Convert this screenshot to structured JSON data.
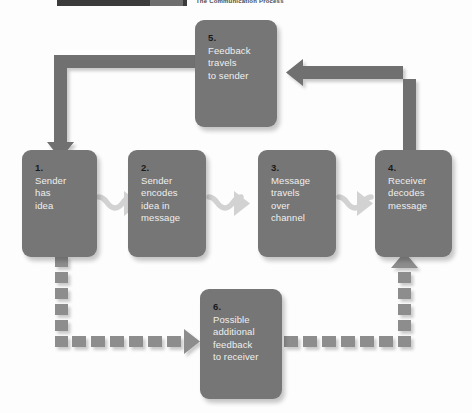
{
  "header": {
    "caption": "The Communication Process",
    "tab_label": "",
    "number_label": ""
  },
  "diagram": {
    "title": "The Communication Process",
    "type": "process-flow-cycle",
    "nodes": [
      {
        "id": "node1",
        "number": "1.",
        "lines": [
          "Sender",
          "has",
          "idea"
        ],
        "text": "Sender has idea"
      },
      {
        "id": "node2",
        "number": "2.",
        "lines": [
          "Sender",
          "encodes",
          "idea in",
          "message"
        ],
        "text": "Sender encodes idea in message"
      },
      {
        "id": "node3",
        "number": "3.",
        "lines": [
          "Message",
          "travels",
          "over",
          "channel"
        ],
        "text": "Message travels over channel"
      },
      {
        "id": "node4",
        "number": "4.",
        "lines": [
          "Receiver",
          "decodes",
          "message"
        ],
        "text": "Receiver decodes message"
      },
      {
        "id": "node5",
        "number": "5.",
        "lines": [
          "Feedback",
          "travels",
          "to sender"
        ],
        "text": "Feedback travels to sender"
      },
      {
        "id": "node6",
        "number": "6.",
        "lines": [
          "Possible",
          "additional",
          "feedback",
          "to receiver"
        ],
        "text": "Possible additional feedback to receiver"
      }
    ],
    "connectors": [
      {
        "id": "c1-2",
        "from": "node1",
        "to": "node2",
        "style": "squiggle",
        "direction": "right"
      },
      {
        "id": "c2-3",
        "from": "node2",
        "to": "node3",
        "style": "squiggle",
        "direction": "right"
      },
      {
        "id": "c3-4",
        "from": "node3",
        "to": "node4",
        "style": "squiggle",
        "direction": "right"
      },
      {
        "id": "c4-5",
        "from": "node4",
        "to": "node5",
        "style": "solid",
        "direction": "left"
      },
      {
        "id": "c5-1",
        "from": "node5",
        "to": "node1",
        "style": "solid",
        "direction": "down"
      },
      {
        "id": "c1-6",
        "from": "node1",
        "to": "node6",
        "style": "dashed",
        "direction": "right"
      },
      {
        "id": "c6-4",
        "from": "node6",
        "to": "node4",
        "style": "dashed",
        "direction": "up"
      }
    ]
  },
  "colors": {
    "node_fill": "#767676",
    "connector_solid": "#6f6f6f",
    "connector_dashed": "#8d8d8d",
    "squiggle": "#d2d2d2",
    "background": "#fdfdfd",
    "header_dark": "#3b3b3b"
  }
}
